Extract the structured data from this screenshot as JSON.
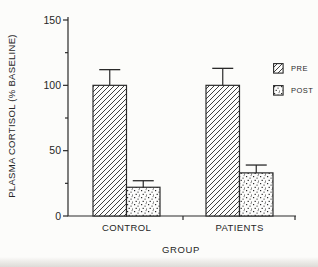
{
  "figure": {
    "kind": "scanned journal bar chart",
    "title": ""
  },
  "colors": {
    "ink": "#2a2a2a",
    "paper": "#fcfcfa",
    "scan_band": "#b2aea6"
  },
  "chart_data": {
    "type": "bar",
    "title": "",
    "xlabel": "GROUP",
    "ylabel": "PLASMA CORTISOL (% BASELINE)",
    "categories": [
      "CONTROL",
      "PATIENTS"
    ],
    "series": [
      {
        "name": "PRE",
        "pattern": "diagonal-hatch",
        "values": [
          100,
          100
        ],
        "errors": [
          12,
          13
        ]
      },
      {
        "name": "POST",
        "pattern": "speckle",
        "values": [
          22,
          33
        ],
        "errors": [
          5,
          6
        ]
      }
    ],
    "ylim": [
      0,
      150
    ],
    "yticks": [
      0,
      50,
      100,
      150
    ],
    "yminor": [
      25,
      75,
      125
    ],
    "grid": "off",
    "legend_position": "right",
    "legend": [
      "PRE",
      "POST"
    ]
  }
}
